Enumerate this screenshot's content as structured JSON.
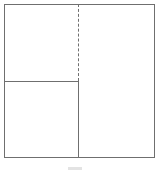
{
  "diagram": {
    "type": "partition-layout",
    "frame": {
      "x": 4,
      "y": 4,
      "width": 150,
      "height": 153,
      "stroke": "#6f6f6f"
    },
    "dividers": [
      {
        "orientation": "vertical",
        "x": 78,
        "y1": 4,
        "y2": 81,
        "style": "dashed"
      },
      {
        "orientation": "vertical",
        "x": 78,
        "y1": 81,
        "y2": 157,
        "style": "solid"
      },
      {
        "orientation": "horizontal",
        "y": 81,
        "x1": 4,
        "x2": 78,
        "style": "solid"
      }
    ],
    "regions": [
      {
        "name": "top-left",
        "label": ""
      },
      {
        "name": "bottom-left",
        "label": ""
      },
      {
        "name": "right",
        "label": ""
      }
    ],
    "caption": ""
  },
  "colors": {
    "stroke": "#6f6f6f",
    "background": "#ffffff",
    "caption": "#e3e3e3"
  }
}
